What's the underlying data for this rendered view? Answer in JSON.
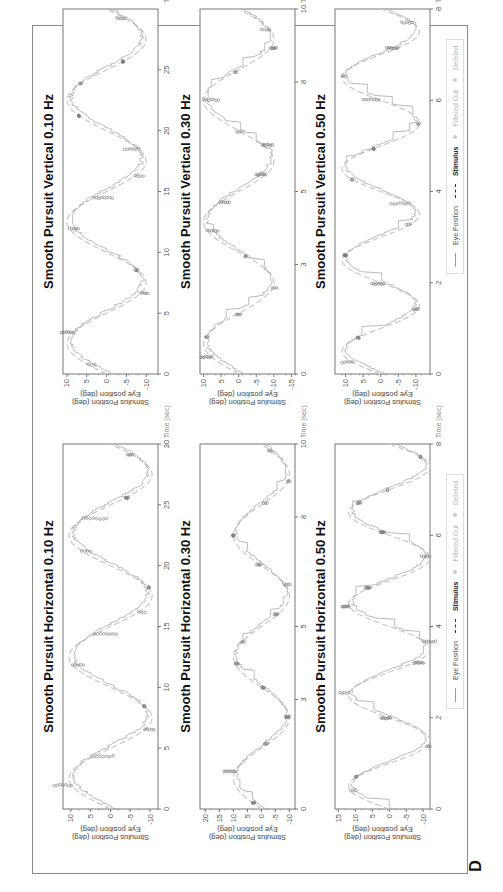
{
  "figure": {
    "panel_letter": "D",
    "legend": {
      "items": [
        {
          "label": "Eye Position",
          "style": "thin gray line"
        },
        {
          "label": "Stimulus",
          "style": "dark dashed line"
        },
        {
          "label": "Filtered Out",
          "style": "light gray dot"
        },
        {
          "label": "Deleted",
          "style": "light gray dot"
        }
      ]
    },
    "colors": {
      "eye_position": "#a8a8a8",
      "stimulus": "#c8c8c8",
      "saccade_markers": "#7a7a7a",
      "frame": "#8a8a8a",
      "title": "#111111"
    }
  },
  "chart_data": [
    {
      "type": "line",
      "title": "Smooth Pursuit Horizontal  0.10 Hz",
      "xlabel": "Time (sec)",
      "ylabel": "Stimulus Position (deg)",
      "ylabel2": "Eye position (deg)",
      "xlim": [
        0,
        30
      ],
      "ylim": [
        -12,
        12
      ],
      "xticks": [
        0,
        5,
        10,
        15,
        20,
        25,
        30
      ],
      "yticks": [
        10,
        5,
        0,
        -5,
        -10
      ],
      "xticklabels": [
        "0",
        "5",
        "10",
        "15",
        "20",
        "25",
        "30"
      ],
      "yticklabels": [
        "10",
        "5",
        "0",
        "-5",
        "-10"
      ],
      "series": [
        {
          "name": "Stimulus",
          "frequency_hz": 0.1,
          "amplitude_deg": 10.5,
          "phase_note": "sine starting near 0 rising"
        },
        {
          "name": "Eye Position",
          "note": "tracks stimulus closely with small catch-up saccades"
        }
      ]
    },
    {
      "type": "line",
      "title": "Smooth Pursuit Horizontal  0.30 Hz",
      "xlabel": "Time (sec)",
      "ylabel": "Stimulus Position (deg)",
      "ylabel2": "Eye position (deg)",
      "xlim": [
        0,
        10
      ],
      "ylim": [
        -12,
        22
      ],
      "xticks": [
        0,
        3,
        5,
        8,
        10
      ],
      "yticks": [
        20,
        15,
        10,
        5,
        0,
        -5,
        -10
      ],
      "xticklabels": [
        "0",
        "3",
        "5",
        "8",
        "10"
      ],
      "yticklabels": [
        "20",
        "15",
        "10",
        "5",
        "0",
        "-5",
        "-10"
      ],
      "series": [
        {
          "name": "Stimulus",
          "frequency_hz": 0.3,
          "amplitude_deg": 10
        },
        {
          "name": "Eye Position",
          "note": "initial overshoot to ~20 deg near t=1.2s then tracks"
        }
      ]
    },
    {
      "type": "line",
      "title": "Smooth Pursuit Horizontal  0.50 Hz",
      "xlabel": "Time (sec)",
      "ylabel": "Stimulus Position (deg)",
      "ylabel2": "Eye position (deg)",
      "xlim": [
        0,
        8
      ],
      "ylim": [
        -12,
        16
      ],
      "xticks": [
        0,
        2,
        4,
        6,
        8
      ],
      "yticks": [
        15,
        10,
        5,
        0,
        -5,
        -10
      ],
      "xticklabels": [
        "0",
        "2",
        "4",
        "6",
        "8"
      ],
      "yticklabels": [
        "15",
        "10",
        "5",
        "0",
        "-5",
        "-10"
      ],
      "series": [
        {
          "name": "Stimulus",
          "frequency_hz": 0.5,
          "amplitude_deg": 12
        },
        {
          "name": "Eye Position",
          "note": "step-like saccadic pursuit"
        }
      ],
      "legend": [
        "Eye Position",
        "Stimulus",
        "Filtered Out",
        "Deleted"
      ]
    },
    {
      "type": "line",
      "title": "Smooth Pursuit Vertical  0.10 Hz",
      "xlabel": "Time (sec)",
      "ylabel": "Stimulus Position (deg)",
      "ylabel2": "Eye position (deg)",
      "xlim": [
        0,
        30
      ],
      "ylim": [
        -13,
        11
      ],
      "xticks": [
        0,
        5,
        10,
        15,
        20,
        25
      ],
      "yticks": [
        10,
        5,
        0,
        -5,
        -10
      ],
      "xticklabels": [
        "0",
        "5",
        "10",
        "15",
        "20",
        "25"
      ],
      "yticklabels": [
        "10",
        "5",
        "0",
        "-5",
        "-10"
      ],
      "series": [
        {
          "name": "Stimulus",
          "frequency_hz": 0.1,
          "amplitude_deg": 10
        },
        {
          "name": "Eye Position",
          "note": "noisy tracking with saccades"
        }
      ]
    },
    {
      "type": "line",
      "title": "Smooth Pursuit Vertical  0.30 Hz",
      "xlabel": "Time (sec)",
      "ylabel": "Stimulus Position (deg)",
      "ylabel2": "Eye position (deg)",
      "xlim": [
        0,
        10
      ],
      "ylim": [
        -16,
        11
      ],
      "xticks": [
        0,
        3,
        5,
        8,
        10
      ],
      "yticks": [
        10,
        5,
        0,
        -5,
        -10,
        -15
      ],
      "xticklabels": [
        "0",
        "3",
        "5",
        "8",
        "10"
      ],
      "yticklabels": [
        "10",
        "5",
        "0",
        "-5",
        "-10",
        "-15"
      ],
      "series": [
        {
          "name": "Stimulus",
          "frequency_hz": 0.3,
          "amplitude_deg": 10
        },
        {
          "name": "Eye Position",
          "note": "saccade to ~-15 near t=3s"
        }
      ]
    },
    {
      "type": "line",
      "title": "Smooth Pursuit Vertical  0.50 Hz",
      "xlabel": "Time (sec)",
      "ylabel": "Stimulus Position (deg)",
      "ylabel2": "Eye position (deg)",
      "xlim": [
        0,
        8
      ],
      "ylim": [
        -14,
        13
      ],
      "xticks": [
        0,
        2,
        4,
        6,
        8
      ],
      "yticks": [
        10,
        5,
        0,
        -5,
        -10
      ],
      "xticklabels": [
        "0",
        "2",
        "4",
        "6",
        "8"
      ],
      "yticklabels": [
        "10",
        "5",
        "0",
        "-5",
        "-10"
      ],
      "series": [
        {
          "name": "Stimulus",
          "frequency_hz": 0.5,
          "amplitude_deg": 11
        },
        {
          "name": "Eye Position",
          "note": "step-like saccadic pursuit"
        }
      ],
      "legend": [
        "Eye Position",
        "Stimulus",
        "Filtered Out",
        "Deleted"
      ]
    }
  ]
}
